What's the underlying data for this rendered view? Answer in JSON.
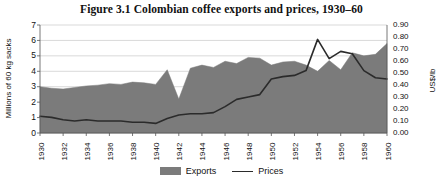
{
  "figure": {
    "title": "Figure 3.1  Colombian coffee exports and prices, 1930–60"
  },
  "axes": {
    "left": {
      "label": "Millions of 60 kg sacks",
      "ticks": [
        "7",
        "6",
        "5",
        "4",
        "3",
        "2",
        "1",
        "0"
      ],
      "min": 0,
      "max": 7
    },
    "right": {
      "label": "US$/lb",
      "ticks": [
        "0.90",
        "0.80",
        "0.70",
        "0.60",
        "0.50",
        "0.40",
        "0.30",
        "0.20",
        "0.10",
        "0.00"
      ],
      "min": 0,
      "max": 0.9
    },
    "bottom": {
      "ticks": [
        "1930",
        "1932",
        "1934",
        "1936",
        "1938",
        "1940",
        "1942",
        "1944",
        "1946",
        "1948",
        "1950",
        "1952",
        "1954",
        "1956",
        "1958",
        "1960"
      ]
    }
  },
  "legend": {
    "items": [
      {
        "label": "Exports",
        "marker": "area-swatch",
        "color": "#7b7b7b"
      },
      {
        "label": "Prices",
        "marker": "line-swatch",
        "color": "#2b2b2b"
      }
    ]
  },
  "colors": {
    "area_fill": "#7b7b7b",
    "line": "#2b2b2b",
    "grid": "#c9c9c9",
    "text": "#111111",
    "background": "#ffffff"
  },
  "chart_data": {
    "type": "area",
    "title": "Figure 3.1  Colombian coffee exports and prices, 1930–60",
    "xlabel": "",
    "ylabel": "Millions of 60 kg sacks",
    "y2label": "US$/lb",
    "xlim": [
      1930,
      1960
    ],
    "ylim": [
      0,
      7
    ],
    "y2lim": [
      0,
      0.9
    ],
    "grid": true,
    "legend_position": "bottom-center",
    "x": [
      1930,
      1931,
      1932,
      1933,
      1934,
      1935,
      1936,
      1937,
      1938,
      1939,
      1940,
      1941,
      1942,
      1943,
      1944,
      1945,
      1946,
      1947,
      1948,
      1949,
      1950,
      1951,
      1952,
      1953,
      1954,
      1955,
      1956,
      1957,
      1958,
      1959,
      1960
    ],
    "series": [
      {
        "name": "Exports",
        "type": "area",
        "axis": "left",
        "unit": "millions of 60 kg sacks",
        "values": [
          3.0,
          2.9,
          2.85,
          2.95,
          3.05,
          3.1,
          3.2,
          3.15,
          3.3,
          3.25,
          3.15,
          4.1,
          2.2,
          4.2,
          4.4,
          4.25,
          4.65,
          4.5,
          4.9,
          4.85,
          4.4,
          4.6,
          4.65,
          4.4,
          4.0,
          4.7,
          4.1,
          5.2,
          5.0,
          5.1,
          5.8
        ]
      },
      {
        "name": "Prices",
        "type": "line",
        "axis": "right",
        "unit": "US$/lb",
        "values": [
          0.14,
          0.13,
          0.11,
          0.1,
          0.11,
          0.1,
          0.1,
          0.1,
          0.09,
          0.09,
          0.08,
          0.12,
          0.15,
          0.16,
          0.16,
          0.17,
          0.22,
          0.28,
          0.3,
          0.32,
          0.45,
          0.47,
          0.48,
          0.52,
          0.78,
          0.62,
          0.68,
          0.66,
          0.52,
          0.46,
          0.45
        ]
      }
    ]
  }
}
